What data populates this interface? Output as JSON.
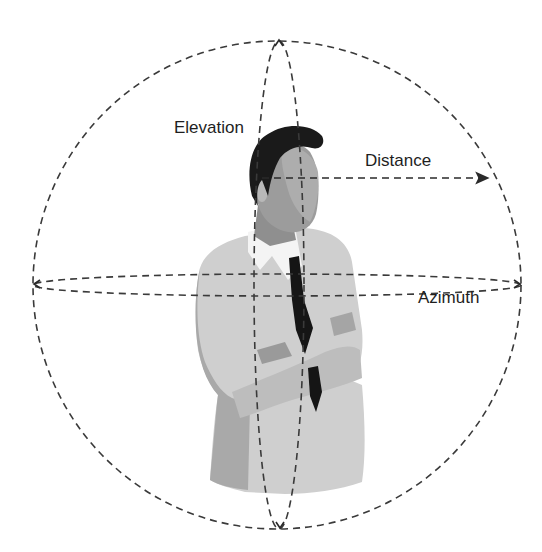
{
  "diagram": {
    "labels": {
      "elevation": "Elevation",
      "distance": "Distance",
      "azimuth": "Azimuth"
    },
    "colors": {
      "line": "#3a3a3a",
      "hair": "#1a1a1a",
      "skin": "#9a9a9a",
      "skin_light": "#b5b5b5",
      "shirt": "#f2f2f2",
      "vest": "#cfcfcf",
      "vest_shadow": "#a8a8a8",
      "tie": "#151515"
    }
  }
}
